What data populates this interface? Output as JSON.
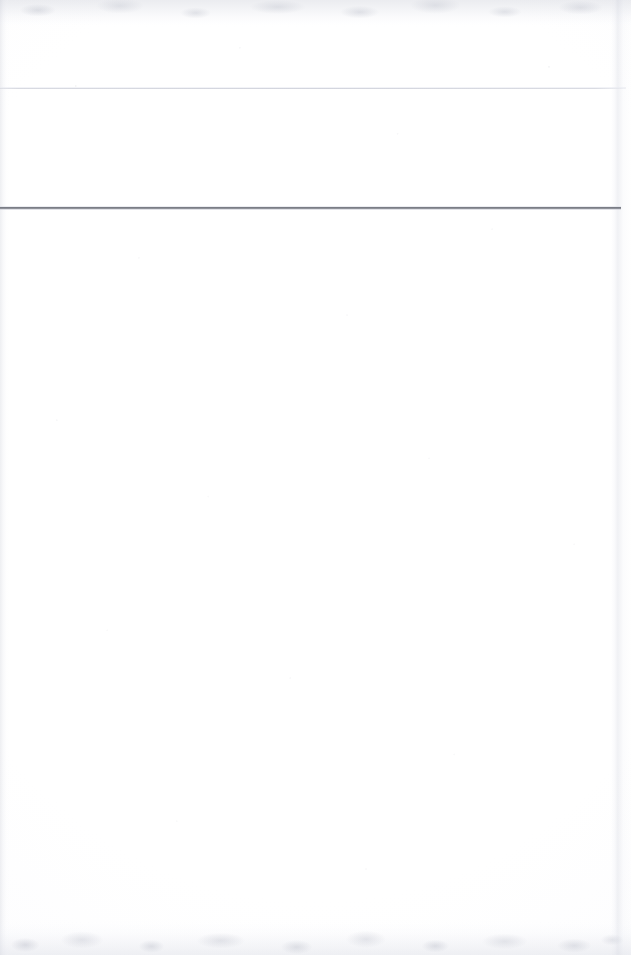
{
  "page": {
    "kind": "scanned-document-page",
    "state": "blank",
    "width": 631,
    "height": 955,
    "paper_color": "#ffffff",
    "header_text": "",
    "subheader_text": "",
    "body_text": "",
    "footer_text": ""
  },
  "rules": [
    {
      "name": "upper-rule",
      "color": "#d3d5de",
      "top": 88,
      "left": 0,
      "width": 626,
      "thickness": 1
    },
    {
      "name": "lower-rule",
      "color": "#6e717a",
      "top": 207,
      "left": 0,
      "width": 621,
      "thickness": 2
    }
  ],
  "artifacts": {
    "top_band_color": "#c4c7d2",
    "bottom_band_color": "#d6d9e2",
    "left_edge_color": "#bec1cd",
    "right_edge_color": "#ced1dc",
    "grain_color": "#787d8c"
  }
}
